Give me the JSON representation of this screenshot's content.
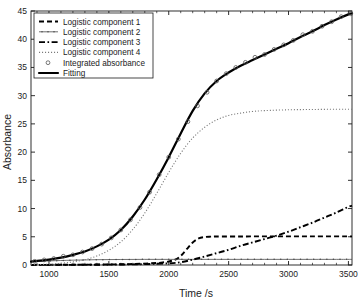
{
  "chart_data": {
    "type": "line",
    "title": "",
    "xlabel": "Time /s",
    "ylabel": "Absorbance",
    "xlim": [
      850,
      3530
    ],
    "ylim": [
      0,
      45
    ],
    "xticks": [
      1000,
      1500,
      2000,
      2500,
      3000,
      3500
    ],
    "yticks": [
      0,
      5,
      10,
      15,
      20,
      25,
      30,
      35,
      40,
      45
    ],
    "xtick_labels": [
      "1000",
      "1500",
      "2000",
      "2500",
      "3000",
      "3500"
    ],
    "ytick_labels": [
      "0",
      "5",
      "10",
      "15",
      "20",
      "25",
      "30",
      "35",
      "40",
      "45"
    ],
    "grid": false,
    "legend_position": "upper-left",
    "minor_ticks": true,
    "series": [
      {
        "name": "Logistic component 1",
        "style": "dashed",
        "color": "#000000",
        "x": [
          850,
          1000,
          1200,
          1400,
          1600,
          1800,
          1950,
          2050,
          2100,
          2150,
          2200,
          2250,
          2300,
          2350,
          2400,
          2600,
          2800,
          3000,
          3200,
          3400,
          3530
        ],
        "y": [
          0.02,
          0.03,
          0.05,
          0.08,
          0.13,
          0.25,
          0.45,
          0.9,
          1.6,
          2.8,
          4.0,
          4.7,
          4.95,
          5.02,
          5.05,
          5.06,
          5.07,
          5.07,
          5.08,
          5.08,
          5.08
        ]
      },
      {
        "name": "Logistic component 2",
        "style": "solid-with-dots",
        "color": "#4a4a4a",
        "x": [
          850,
          1000,
          1200,
          1400,
          1600,
          1800,
          2000,
          2200,
          2400,
          2600,
          2800,
          3000,
          3200,
          3400,
          3530
        ],
        "y": [
          0.55,
          0.72,
          0.86,
          0.94,
          0.98,
          1.0,
          1.0,
          1.0,
          1.0,
          1.0,
          1.0,
          1.0,
          1.0,
          1.0,
          1.0
        ]
      },
      {
        "name": "Logistic component 3",
        "style": "dash-dot",
        "color": "#000000",
        "x": [
          850,
          1000,
          1300,
          1600,
          1800,
          2000,
          2100,
          2200,
          2300,
          2400,
          2500,
          2600,
          2700,
          2800,
          2900,
          3000,
          3100,
          3200,
          3300,
          3400,
          3500,
          3530
        ],
        "y": [
          0.01,
          0.02,
          0.04,
          0.09,
          0.16,
          0.3,
          0.5,
          0.95,
          1.5,
          2.1,
          2.7,
          3.4,
          4.0,
          4.6,
          5.2,
          5.9,
          6.7,
          7.5,
          8.4,
          9.3,
          10.3,
          10.5
        ]
      },
      {
        "name": "Logistic component 4",
        "style": "dotted",
        "color": "#7a7a7a",
        "x": [
          850,
          1000,
          1100,
          1200,
          1300,
          1400,
          1500,
          1600,
          1700,
          1800,
          1900,
          2000,
          2100,
          2200,
          2300,
          2400,
          2500,
          2600,
          2700,
          2800,
          3000,
          3200,
          3400,
          3530
        ],
        "y": [
          0.05,
          0.15,
          0.3,
          0.55,
          0.95,
          1.6,
          2.6,
          4.1,
          6.3,
          9.2,
          12.7,
          16.4,
          19.8,
          22.5,
          24.4,
          25.7,
          26.5,
          26.9,
          27.2,
          27.35,
          27.5,
          27.55,
          27.6,
          27.6
        ]
      },
      {
        "name": "Fitting",
        "style": "thick-solid",
        "color": "#000000",
        "x": [
          850,
          1000,
          1100,
          1200,
          1300,
          1400,
          1500,
          1600,
          1700,
          1800,
          1900,
          2000,
          2100,
          2200,
          2300,
          2400,
          2500,
          2600,
          2700,
          2800,
          2900,
          3000,
          3100,
          3200,
          3300,
          3400,
          3500,
          3530
        ],
        "y": [
          0.6,
          0.95,
          1.3,
          1.8,
          2.4,
          3.3,
          4.5,
          6.2,
          8.6,
          11.6,
          15.2,
          19.1,
          23.3,
          27.3,
          30.4,
          32.6,
          34.1,
          35.3,
          36.3,
          37.3,
          38.3,
          39.3,
          40.4,
          41.4,
          42.5,
          43.5,
          44.4,
          44.6
        ]
      },
      {
        "name": "Integrated absorbance",
        "style": "circle-markers",
        "color": "#555555",
        "x": [
          880,
          960,
          1040,
          1120,
          1200,
          1280,
          1360,
          1440,
          1520,
          1600,
          1680,
          1760,
          1840,
          1920,
          2000,
          2080,
          2160,
          2240,
          2320,
          2400,
          2480,
          2560,
          2640,
          2720,
          2800,
          2880,
          2960,
          3040,
          3120,
          3200,
          3280,
          3360,
          3440,
          3520
        ],
        "y": [
          0.65,
          0.9,
          1.15,
          1.55,
          1.8,
          2.3,
          2.9,
          3.7,
          4.8,
          6.2,
          8.0,
          10.2,
          12.9,
          16.0,
          19.1,
          22.3,
          25.4,
          28.2,
          30.6,
          32.6,
          33.9,
          35.0,
          35.9,
          36.8,
          37.3,
          38.2,
          39.0,
          39.8,
          40.8,
          41.4,
          42.3,
          43.1,
          44.0,
          44.5
        ]
      }
    ]
  },
  "legend": {
    "items": [
      {
        "label": "Logistic component 1",
        "style": "dashed"
      },
      {
        "label": "Logistic component 2",
        "style": "solid-with-dots"
      },
      {
        "label": "Logistic component 3",
        "style": "dash-dot"
      },
      {
        "label": "Logistic component 4",
        "style": "dotted"
      },
      {
        "label": "Integrated absorbance",
        "style": "circle-markers"
      },
      {
        "label": "Fitting",
        "style": "thick-solid"
      }
    ]
  }
}
